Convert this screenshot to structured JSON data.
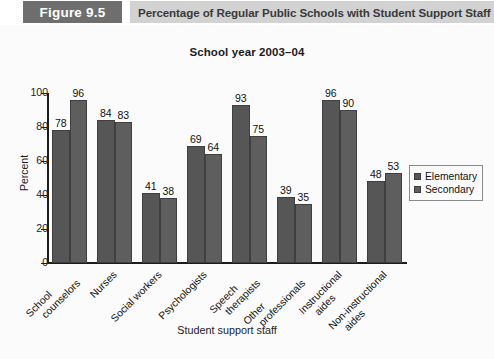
{
  "header": {
    "figure_badge": "Figure 9.5",
    "figure_title": "Percentage of Regular Public Schools with Student Support Staff",
    "badge_bg": "#6e6e6e",
    "band_bg": "#d2d2d2"
  },
  "chart_data": {
    "type": "bar",
    "title": "School year 2003–04",
    "xlabel": "Student support staff",
    "ylabel": "Percent",
    "ylim": [
      0,
      100
    ],
    "yticks": [
      0,
      20,
      40,
      60,
      80,
      100
    ],
    "grid": false,
    "legend_position": "right",
    "categories": [
      "School counselors",
      "Nurses",
      "Social workers",
      "Psychologists",
      "Speech therapists",
      "Other professionals",
      "Instructional aides",
      "Non-instructional aides"
    ],
    "category_lines": [
      [
        "School",
        "counselors"
      ],
      [
        "Nurses"
      ],
      [
        "Social workers"
      ],
      [
        "Psychologists"
      ],
      [
        "Speech",
        "therapists"
      ],
      [
        "Other",
        "professionals"
      ],
      [
        "Instructional",
        "aides"
      ],
      [
        "Non-instructional",
        "aides"
      ]
    ],
    "series": [
      {
        "name": "Elementary",
        "color": "#565656",
        "values": [
          78,
          84,
          41,
          69,
          93,
          39,
          96,
          48
        ]
      },
      {
        "name": "Secondary",
        "color": "#5e5e5e",
        "values": [
          96,
          83,
          38,
          64,
          75,
          35,
          90,
          53
        ]
      }
    ]
  },
  "legend": {
    "items": [
      {
        "label": "Elementary",
        "color": "#565656"
      },
      {
        "label": "Secondary",
        "color": "#5e5e5e"
      }
    ]
  },
  "source_note": ""
}
